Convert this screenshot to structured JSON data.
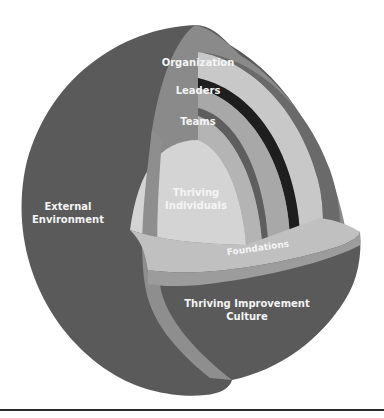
{
  "diagram": {
    "type": "cutaway-sphere",
    "layers": [
      {
        "id": "external",
        "label_lines": [
          "External",
          "Environment"
        ]
      },
      {
        "id": "organization",
        "label": "Organization"
      },
      {
        "id": "leaders",
        "label": "Leaders"
      },
      {
        "id": "teams",
        "label": "Teams"
      },
      {
        "id": "individuals",
        "label_lines": [
          "Thriving",
          "Individuals"
        ]
      },
      {
        "id": "foundations",
        "label": "Foundations"
      },
      {
        "id": "culture",
        "label_lines": [
          "Thriving Improvement",
          "Culture"
        ]
      }
    ],
    "colors": {
      "outer_shell": "#5a5a5a",
      "cut_face": "#8a8a8a",
      "organization_band": "#c8c8c8",
      "leaders_band": "#a8a8a8",
      "dark_line": "#1e1e1e",
      "teams_band": "#b4b4b4",
      "core": "#d4d4d4",
      "foundations": "#c0c0c0",
      "label_text": "#f4f4f4",
      "rule": "#2b2b2b"
    }
  }
}
